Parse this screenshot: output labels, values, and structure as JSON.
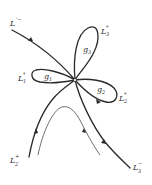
{
  "diagram": {
    "labels": {
      "L_prime_minus": {
        "main": "L",
        "sup": "'−",
        "sub": ""
      },
      "L3_star": {
        "main": "L",
        "sup": "*",
        "sub": "3"
      },
      "L1_star": {
        "main": "L",
        "sup": "*",
        "sub": "1"
      },
      "L2_star": {
        "main": "L",
        "sup": "*",
        "sub": "2"
      },
      "L2_plus": {
        "main": "L",
        "sup": "+",
        "sub": "2"
      },
      "L3_minus": {
        "main": "L",
        "sup": "−",
        "sub": "3"
      }
    },
    "regions": {
      "g1": {
        "main": "g",
        "sub": "1"
      },
      "g2": {
        "main": "g",
        "sub": "2"
      },
      "g3": {
        "main": "g",
        "sub": "3"
      }
    },
    "stroke_color": "#2a2a2a",
    "background": "#ffffff"
  }
}
